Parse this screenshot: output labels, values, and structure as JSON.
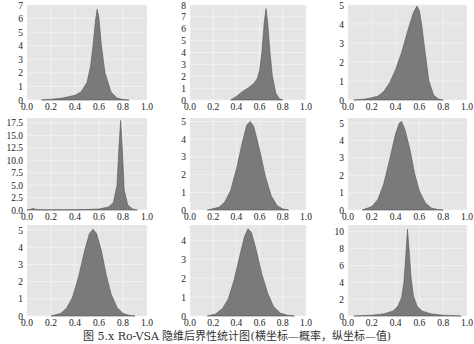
{
  "figure": {
    "caption": "图 5.x  Ro-VSA 隐维后界性统计图(横坐标—概率，纵坐标—值)",
    "style": {
      "plot_background": "#e5e5e5",
      "grid_color": "#f4f4f4",
      "fill_color": "#7a7a7a",
      "edge_color": "#555555"
    }
  },
  "chart_data": [
    {
      "type": "area",
      "title": "",
      "xlabel": "",
      "ylabel": "",
      "xlim": [
        0.0,
        1.0
      ],
      "ylim": [
        0,
        7
      ],
      "xticks": [
        "0.0",
        "0.2",
        "0.4",
        "0.6",
        "0.8",
        "1.0"
      ],
      "yticks": [
        "0",
        "1",
        "2",
        "3",
        "4",
        "5",
        "6",
        "7"
      ],
      "yticks_values": [
        0,
        1,
        2,
        3,
        4,
        5,
        6,
        7
      ],
      "grid": true,
      "x": [
        0.12,
        0.2,
        0.3,
        0.4,
        0.45,
        0.5,
        0.53,
        0.55,
        0.57,
        0.585,
        0.6,
        0.62,
        0.65,
        0.7,
        0.75,
        0.8,
        0.85
      ],
      "values": [
        0,
        0.05,
        0.15,
        0.35,
        0.6,
        1.3,
        2.5,
        4.0,
        5.8,
        6.7,
        6.0,
        4.0,
        2.0,
        0.6,
        0.15,
        0.03,
        0
      ]
    },
    {
      "type": "area",
      "xlim": [
        0.0,
        1.0
      ],
      "ylim": [
        0,
        8
      ],
      "xticks": [
        "0.0",
        "0.2",
        "0.4",
        "0.6",
        "0.8",
        "1.0"
      ],
      "yticks": [
        "0",
        "1",
        "2",
        "3",
        "4",
        "5",
        "6",
        "7",
        "8"
      ],
      "yticks_values": [
        0,
        1,
        2,
        3,
        4,
        5,
        6,
        7,
        8
      ],
      "grid": true,
      "x": [
        0.35,
        0.4,
        0.45,
        0.5,
        0.55,
        0.58,
        0.6,
        0.62,
        0.64,
        0.655,
        0.67,
        0.69,
        0.71,
        0.74,
        0.77,
        0.8
      ],
      "values": [
        0,
        0.3,
        0.7,
        1.0,
        1.4,
        1.8,
        2.5,
        4.0,
        6.5,
        7.7,
        6.5,
        4.0,
        2.0,
        0.6,
        0.1,
        0
      ]
    },
    {
      "type": "area",
      "xlim": [
        0.0,
        1.0
      ],
      "ylim": [
        0,
        5
      ],
      "xticks": [
        "0.0",
        "0.2",
        "0.4",
        "0.6",
        "0.8",
        "1.0"
      ],
      "yticks": [
        "0",
        "1",
        "2",
        "3",
        "4",
        "5"
      ],
      "yticks_values": [
        0,
        1,
        2,
        3,
        4,
        5
      ],
      "grid": true,
      "x": [
        0.05,
        0.15,
        0.25,
        0.3,
        0.35,
        0.4,
        0.45,
        0.5,
        0.55,
        0.58,
        0.6,
        0.62,
        0.65,
        0.68,
        0.72,
        0.76,
        0.8
      ],
      "values": [
        0,
        0.05,
        0.2,
        0.45,
        0.9,
        1.6,
        2.5,
        3.6,
        4.6,
        4.95,
        4.7,
        3.9,
        2.4,
        1.0,
        0.25,
        0.05,
        0
      ]
    },
    {
      "type": "area",
      "xlim": [
        0.0,
        1.0
      ],
      "ylim": [
        0,
        18.5
      ],
      "xticks": [
        "0.0",
        "0.2",
        "0.4",
        "0.6",
        "0.8",
        "1.0"
      ],
      "yticks": [
        "0.0",
        "2.5",
        "5.0",
        "7.5",
        "10.0",
        "12.5",
        "15.0",
        "17.5"
      ],
      "yticks_values": [
        0,
        2.5,
        5,
        7.5,
        10,
        12.5,
        15,
        17.5
      ],
      "grid": true,
      "x": [
        0.0,
        0.03,
        0.05,
        0.07,
        0.1,
        0.3,
        0.5,
        0.6,
        0.68,
        0.72,
        0.75,
        0.765,
        0.78,
        0.795,
        0.81,
        0.84,
        0.88,
        0.92
      ],
      "values": [
        0,
        0.15,
        0.3,
        0.15,
        0.05,
        0.05,
        0.1,
        0.2,
        0.6,
        1.5,
        5.0,
        12.0,
        18.0,
        12.0,
        4.0,
        1.0,
        0.2,
        0
      ]
    },
    {
      "type": "area",
      "xlim": [
        0.0,
        1.0
      ],
      "ylim": [
        0,
        5.2
      ],
      "xticks": [
        "0.0",
        "0.2",
        "0.4",
        "0.6",
        "0.8",
        "1.0"
      ],
      "yticks": [
        "0",
        "1",
        "2",
        "3",
        "4",
        "5"
      ],
      "yticks_values": [
        0,
        1,
        2,
        3,
        4,
        5
      ],
      "grid": true,
      "x": [
        0.15,
        0.25,
        0.3,
        0.35,
        0.4,
        0.45,
        0.49,
        0.52,
        0.55,
        0.6,
        0.65,
        0.7,
        0.75,
        0.8,
        0.85
      ],
      "values": [
        0,
        0.15,
        0.45,
        1.1,
        2.3,
        3.8,
        4.8,
        5.0,
        4.7,
        3.4,
        1.9,
        0.8,
        0.25,
        0.06,
        0
      ]
    },
    {
      "type": "area",
      "xlim": [
        0.0,
        1.0
      ],
      "ylim": [
        0,
        5.3
      ],
      "xticks": [
        "0.0",
        "0.2",
        "0.4",
        "0.6",
        "0.8",
        "1.0"
      ],
      "yticks": [
        "0",
        "1",
        "2",
        "3",
        "4",
        "5"
      ],
      "yticks_values": [
        0,
        1,
        2,
        3,
        4,
        5
      ],
      "grid": true,
      "x": [
        0.12,
        0.2,
        0.25,
        0.3,
        0.35,
        0.4,
        0.43,
        0.45,
        0.48,
        0.52,
        0.56,
        0.6,
        0.65,
        0.7,
        0.75,
        0.8
      ],
      "values": [
        0,
        0.2,
        0.6,
        1.5,
        2.9,
        4.4,
        5.0,
        5.1,
        4.6,
        3.5,
        2.1,
        1.1,
        0.4,
        0.12,
        0.03,
        0
      ]
    },
    {
      "type": "area",
      "xlim": [
        0.0,
        1.0
      ],
      "ylim": [
        0,
        5.3
      ],
      "xticks": [
        "0.0",
        "0.2",
        "0.4",
        "0.6",
        "0.8",
        "1.0"
      ],
      "yticks": [
        "0",
        "1",
        "2",
        "3",
        "4",
        "5"
      ],
      "yticks_values": [
        0,
        1,
        2,
        3,
        4,
        5
      ],
      "grid": true,
      "x": [
        0.2,
        0.28,
        0.33,
        0.38,
        0.43,
        0.48,
        0.52,
        0.55,
        0.58,
        0.62,
        0.66,
        0.7,
        0.75,
        0.8,
        0.85,
        0.9
      ],
      "values": [
        0,
        0.15,
        0.45,
        1.1,
        2.3,
        3.8,
        4.8,
        5.05,
        4.8,
        3.8,
        2.4,
        1.3,
        0.5,
        0.15,
        0.04,
        0
      ]
    },
    {
      "type": "area",
      "xlim": [
        0.0,
        1.0
      ],
      "ylim": [
        0,
        4.8
      ],
      "xticks": [
        "0.0",
        "0.2",
        "0.4",
        "0.6",
        "0.8",
        "1.0"
      ],
      "yticks": [
        "0",
        "1",
        "2",
        "3",
        "4"
      ],
      "yticks_values": [
        0,
        1,
        2,
        3,
        4
      ],
      "grid": true,
      "x": [
        0.15,
        0.22,
        0.28,
        0.33,
        0.38,
        0.43,
        0.47,
        0.5,
        0.53,
        0.57,
        0.62,
        0.67,
        0.72,
        0.78,
        0.84,
        0.9
      ],
      "values": [
        0,
        0.1,
        0.4,
        0.9,
        1.9,
        3.2,
        4.2,
        4.6,
        4.4,
        3.5,
        2.2,
        1.2,
        0.5,
        0.15,
        0.04,
        0
      ]
    },
    {
      "type": "area",
      "xlim": [
        0.0,
        1.0
      ],
      "ylim": [
        0,
        10.8
      ],
      "xticks": [
        "0.0",
        "0.2",
        "0.4",
        "0.6",
        "0.8",
        "1.0"
      ],
      "yticks": [
        "0",
        "2",
        "4",
        "6",
        "8",
        "10"
      ],
      "yticks_values": [
        0,
        2,
        4,
        6,
        8,
        10
      ],
      "grid": true,
      "x": [
        0.05,
        0.2,
        0.3,
        0.38,
        0.42,
        0.45,
        0.47,
        0.485,
        0.5,
        0.515,
        0.53,
        0.55,
        0.58,
        0.62,
        0.7,
        0.8,
        0.95
      ],
      "values": [
        0,
        0.1,
        0.25,
        0.6,
        1.2,
        2.2,
        4.0,
        7.0,
        10.3,
        7.5,
        4.5,
        2.4,
        1.2,
        0.6,
        0.25,
        0.1,
        0
      ]
    }
  ]
}
